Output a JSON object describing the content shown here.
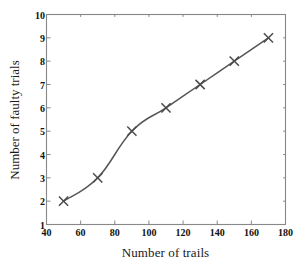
{
  "chart_data": {
    "type": "line",
    "title": "",
    "subtitle": "",
    "xlabel": "Number of trails",
    "ylabel": "Number of faulty trials",
    "x": [
      50,
      70,
      90,
      110,
      130,
      150,
      170
    ],
    "values": [
      2,
      3,
      5,
      6,
      7,
      8,
      9
    ],
    "series": [
      {
        "name": "faulty trials",
        "x": [
          50,
          70,
          90,
          110,
          130,
          150,
          170
        ],
        "values": [
          2,
          3,
          5,
          6,
          7,
          8,
          9
        ],
        "marker": "x",
        "color": "#555555"
      }
    ],
    "xlim": [
      40,
      180
    ],
    "ylim": [
      1,
      10
    ],
    "xticks": [
      40,
      60,
      80,
      100,
      120,
      140,
      160,
      180
    ],
    "yticks": [
      1,
      2,
      3,
      4,
      5,
      6,
      7,
      8,
      9,
      10
    ],
    "xtick_labels": [
      "40",
      "60",
      "80",
      "100",
      "120",
      "140",
      "160",
      "180"
    ],
    "ytick_labels": [
      "1",
      "2",
      "3",
      "4",
      "5",
      "6",
      "7",
      "8",
      "9",
      "10"
    ],
    "grid": false,
    "legend": false,
    "legend_position": "none",
    "tick_direction": "in",
    "frame": "box",
    "annotations": [],
    "line_color": "#555555",
    "marker_color": "#4a4a4a",
    "axis_color": "#888888",
    "background_color": "#ffffff"
  }
}
